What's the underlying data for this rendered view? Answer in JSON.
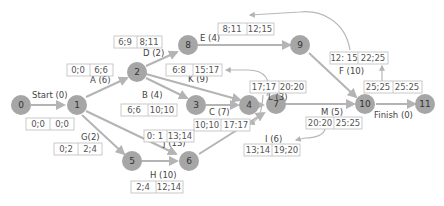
{
  "colors": {
    "node_fill": "#a6a6a6",
    "edge": "#b4b4b4",
    "box_border": "#bcbcbc",
    "text": "#444444"
  },
  "nodes": [
    {
      "id": "0",
      "label": "0"
    },
    {
      "id": "1",
      "label": "1"
    },
    {
      "id": "2",
      "label": "2"
    },
    {
      "id": "3",
      "label": "3"
    },
    {
      "id": "4",
      "label": "4"
    },
    {
      "id": "5",
      "label": "5"
    },
    {
      "id": "6",
      "label": "6"
    },
    {
      "id": "7",
      "label": "7"
    },
    {
      "id": "8",
      "label": "8"
    },
    {
      "id": "9",
      "label": "9"
    },
    {
      "id": "10",
      "label": "10"
    },
    {
      "id": "11",
      "label": "11"
    }
  ],
  "activities": {
    "start": {
      "label": "Start (0)",
      "from": "0",
      "to": "1",
      "es_ef": "0;0",
      "ls_lf": "0;0"
    },
    "a": {
      "label": "A (6)",
      "from": "1",
      "to": "2",
      "es_ef": "0;0",
      "ls_lf": "6;6"
    },
    "b": {
      "label": "B (4)",
      "from": "2",
      "to": "3",
      "es_ef": "6;6",
      "ls_lf": "10;10"
    },
    "c": {
      "label": "C (7)",
      "from": "3",
      "to": "4",
      "es_ef": "10;10",
      "ls_lf": "17:17"
    },
    "d": {
      "label": "D (2)",
      "from": "2",
      "to": "8",
      "es_ef": "6;9",
      "ls_lf": "8;11"
    },
    "e": {
      "label": "E (4)",
      "from": "8",
      "to": "9",
      "es_ef": "8;11",
      "ls_lf": "12;15"
    },
    "f": {
      "label": "F (10)",
      "from": "9",
      "to": "10",
      "es_ef": "12: 15",
      "ls_lf": "22;25"
    },
    "g": {
      "label": "G(2)",
      "from": "1",
      "to": "5",
      "es_ef": "0;2",
      "ls_lf": "2;4"
    },
    "h": {
      "label": "H (10)",
      "from": "5",
      "to": "6",
      "es_ef": "2;4",
      "ls_lf": "12;14"
    },
    "i": {
      "label": "I (6)",
      "from": "6",
      "to": "7",
      "es_ef": "13;14",
      "ls_lf": "19;20"
    },
    "j": {
      "label": "J (13)",
      "from": "1",
      "to": "6",
      "es_ef": "0: 1",
      "ls_lf": "13;14"
    },
    "k": {
      "label": "K (9)",
      "from": "2",
      "to": "4",
      "es_ef": "6:8",
      "ls_lf": "15:17"
    },
    "l": {
      "label": "L (3)",
      "from": "4",
      "to": "7",
      "es_ef": "17;17",
      "ls_lf": "20:20"
    },
    "m": {
      "label": "M (5)",
      "from": "7",
      "to": "10",
      "es_ef": "20:20",
      "ls_lf": "25:25"
    },
    "finish": {
      "label": "Finish (0)",
      "from": "10",
      "to": "11",
      "es_ef": "25;25",
      "ls_lf": "25:25"
    }
  }
}
